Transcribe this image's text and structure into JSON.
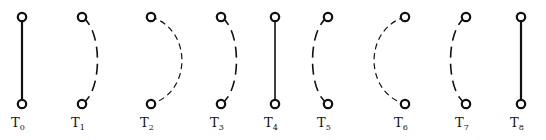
{
  "diagram": {
    "title": "",
    "stroke_color": "#111111",
    "background": "#ffffff",
    "figures": [
      {
        "label": "T",
        "subscript": "0",
        "edge_style": "solid",
        "curvature": "straight",
        "bulge": 0
      },
      {
        "label": "T",
        "subscript": "1",
        "edge_style": "long-dash",
        "curvature": "right",
        "bulge": 0.5
      },
      {
        "label": "T",
        "subscript": "2",
        "edge_style": "short-dash",
        "curvature": "right",
        "bulge": 1.0
      },
      {
        "label": "T",
        "subscript": "3",
        "edge_style": "long-dash",
        "curvature": "right",
        "bulge": 0.5
      },
      {
        "label": "T",
        "subscript": "4",
        "edge_style": "solid-thin",
        "curvature": "straight",
        "bulge": 0
      },
      {
        "label": "T",
        "subscript": "5",
        "edge_style": "long-dash",
        "curvature": "left",
        "bulge": 0.5
      },
      {
        "label": "T",
        "subscript": "6",
        "edge_style": "short-dash",
        "curvature": "left",
        "bulge": 1.0
      },
      {
        "label": "T",
        "subscript": "7",
        "edge_style": "long-dash",
        "curvature": "left",
        "bulge": 0.5
      },
      {
        "label": "T",
        "subscript": "8",
        "edge_style": "solid",
        "curvature": "straight",
        "bulge": 0
      }
    ]
  }
}
